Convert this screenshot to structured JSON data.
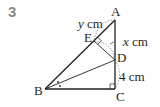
{
  "problem_number": "3",
  "points": {
    "A": {
      "label": "A",
      "x": 115,
      "y": 20
    },
    "B": {
      "label": "B",
      "x": 45,
      "y": 89
    },
    "C": {
      "label": "C",
      "x": 115,
      "y": 89
    },
    "D": {
      "label": "D",
      "x": 115,
      "y": 60
    },
    "E": {
      "label": "E",
      "x": 94,
      "y": 41
    }
  },
  "measures": {
    "AE": {
      "var": "y",
      "unit": " cm"
    },
    "ED": {
      "var": "x",
      "unit": " cm"
    },
    "DC": {
      "value": "4",
      "unit": " cm"
    }
  },
  "colors": {
    "line": "#231f20",
    "number": "#8a8a8a"
  }
}
